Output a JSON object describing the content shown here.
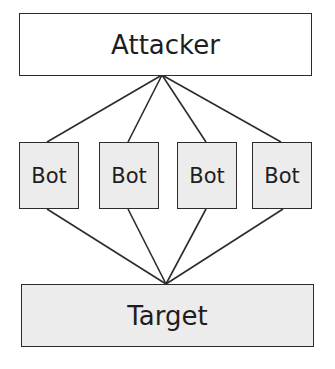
{
  "diagram": {
    "nodes": {
      "attacker": {
        "label": "Attacker"
      },
      "bots": [
        {
          "label": "Bot"
        },
        {
          "label": "Bot"
        },
        {
          "label": "Bot"
        },
        {
          "label": "Bot"
        }
      ],
      "target": {
        "label": "Target"
      }
    },
    "edges": [
      {
        "from": "attacker",
        "to": "bot-1"
      },
      {
        "from": "attacker",
        "to": "bot-2"
      },
      {
        "from": "attacker",
        "to": "bot-3"
      },
      {
        "from": "attacker",
        "to": "bot-4"
      },
      {
        "from": "bot-1",
        "to": "target"
      },
      {
        "from": "bot-2",
        "to": "target"
      },
      {
        "from": "bot-3",
        "to": "target"
      },
      {
        "from": "bot-4",
        "to": "target"
      }
    ],
    "colors": {
      "stroke": "#2b2b2b",
      "attacker_fill": "#ffffff",
      "node_fill": "#ececec",
      "text": "#1e1e1e"
    }
  }
}
